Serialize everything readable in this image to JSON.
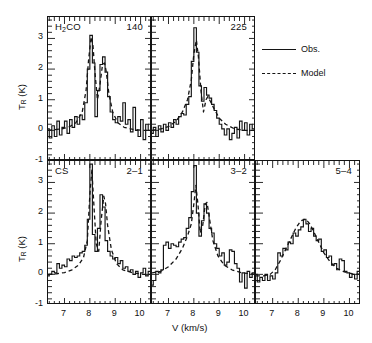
{
  "figure": {
    "axis_x_title": "V (km/s)",
    "axis_y_title": "T_R (K)",
    "y_ticks": [
      "-1",
      "0",
      "1",
      "2",
      "3"
    ],
    "x_ticks": [
      "7",
      "8",
      "9",
      "10"
    ]
  },
  "legend": {
    "obs_label": "Obs.",
    "model_label": "Model",
    "obs_style": "solid",
    "model_style": "dashed",
    "line_color": "#141414"
  },
  "panels": [
    {
      "id": "h2co-140",
      "left_label": "H2CO",
      "left_label_html": "H<sub>2</sub>CO",
      "right_label": "140",
      "row": 0,
      "col": 0
    },
    {
      "id": "h2co-225",
      "left_label": "",
      "left_label_html": "",
      "right_label": "225",
      "row": 0,
      "col": 1
    },
    {
      "id": "cs-2-1",
      "left_label": "CS",
      "left_label_html": "CS",
      "right_label": "2–1",
      "row": 1,
      "col": 0
    },
    {
      "id": "cs-3-2",
      "left_label": "",
      "left_label_html": "",
      "right_label": "3–2",
      "row": 1,
      "col": 1
    },
    {
      "id": "cs-5-4",
      "left_label": "",
      "left_label_html": "",
      "right_label": "5–4",
      "row": 1,
      "col": 2
    }
  ],
  "chart_data": {
    "type": "line",
    "title": "",
    "xlabel": "V (km/s)",
    "ylabel": "T_R (K)",
    "xlim": [
      6.35,
      10.45
    ],
    "ylim": [
      -1.0,
      3.7
    ],
    "grid": false,
    "legend_position": "right-outside",
    "series_names": [
      "Obs.",
      "Model"
    ],
    "panels": [
      {
        "name": "H2CO 140",
        "left_label": "H2CO",
        "right_label": "140",
        "obs": {
          "style": "step",
          "x": [
            6.35,
            6.45,
            6.55,
            6.65,
            6.75,
            6.85,
            6.95,
            7.05,
            7.15,
            7.25,
            7.35,
            7.45,
            7.55,
            7.65,
            7.75,
            7.85,
            7.95,
            8.05,
            8.15,
            8.25,
            8.35,
            8.45,
            8.55,
            8.65,
            8.75,
            8.85,
            8.95,
            9.05,
            9.15,
            9.25,
            9.35,
            9.45,
            9.55,
            9.65,
            9.75,
            9.85,
            9.95,
            10.05,
            10.15,
            10.25,
            10.35,
            10.45
          ],
          "y": [
            0.05,
            -0.25,
            0.15,
            -0.2,
            0.3,
            -0.15,
            0.1,
            0.3,
            -0.1,
            0.35,
            0.1,
            0.45,
            0.2,
            0.5,
            0.35,
            0.9,
            2.0,
            3.1,
            2.2,
            0.45,
            1.3,
            2.15,
            2.4,
            1.9,
            1.1,
            0.6,
            0.35,
            0.25,
            0.45,
            0.3,
            0.9,
            0.2,
            0.35,
            -0.05,
            0.75,
            0.0,
            -0.2,
            0.35,
            -0.3,
            0.2,
            0.0,
            0.05
          ]
        },
        "model": {
          "style": "smooth",
          "x": [
            6.35,
            6.6,
            6.9,
            7.2,
            7.45,
            7.7,
            7.85,
            7.95,
            8.05,
            8.12,
            8.2,
            8.3,
            8.4,
            8.5,
            8.58,
            8.65,
            8.75,
            8.9,
            9.1,
            9.35,
            9.7,
            10.1,
            10.45
          ],
          "y": [
            0.0,
            0.02,
            0.05,
            0.12,
            0.25,
            0.6,
            1.3,
            2.3,
            3.05,
            2.8,
            1.9,
            1.0,
            1.5,
            2.15,
            2.2,
            1.9,
            1.2,
            0.6,
            0.25,
            0.1,
            0.03,
            0.0,
            0.0
          ]
        }
      },
      {
        "name": "H2CO 225",
        "left_label": "",
        "right_label": "225",
        "obs": {
          "style": "step",
          "x": [
            6.35,
            6.45,
            6.55,
            6.65,
            6.75,
            6.85,
            6.95,
            7.05,
            7.15,
            7.25,
            7.35,
            7.45,
            7.55,
            7.65,
            7.75,
            7.85,
            7.95,
            8.05,
            8.15,
            8.25,
            8.35,
            8.45,
            8.55,
            8.65,
            8.75,
            8.85,
            8.95,
            9.05,
            9.15,
            9.25,
            9.35,
            9.45,
            9.55,
            9.65,
            9.75,
            9.85,
            9.95,
            10.05,
            10.15,
            10.25,
            10.35,
            10.45
          ],
          "y": [
            -0.1,
            0.1,
            -0.2,
            0.15,
            -0.05,
            0.2,
            0.0,
            0.25,
            0.1,
            0.35,
            0.2,
            0.45,
            0.55,
            0.5,
            0.85,
            1.1,
            2.25,
            3.35,
            2.55,
            1.45,
            0.95,
            1.4,
            1.15,
            1.05,
            0.85,
            0.65,
            0.4,
            0.2,
            0.05,
            -0.15,
            0.05,
            -0.3,
            -0.1,
            0.1,
            -0.25,
            0.3,
            0.0,
            0.25,
            -0.15,
            0.2,
            0.05,
            0.1
          ]
        },
        "model": {
          "style": "smooth",
          "x": [
            6.35,
            6.7,
            7.0,
            7.3,
            7.55,
            7.75,
            7.9,
            8.0,
            8.1,
            8.18,
            8.28,
            8.38,
            8.48,
            8.55,
            8.65,
            8.8,
            9.0,
            9.25,
            9.6,
            10.0,
            10.45
          ],
          "y": [
            0.0,
            0.05,
            0.12,
            0.3,
            0.6,
            1.0,
            1.65,
            2.5,
            2.95,
            2.4,
            1.3,
            0.6,
            1.0,
            1.1,
            0.95,
            0.7,
            0.4,
            0.2,
            0.05,
            0.0,
            0.0
          ]
        }
      },
      {
        "name": "CS 2-1",
        "left_label": "CS",
        "right_label": "2-1",
        "obs": {
          "style": "step",
          "x": [
            6.35,
            6.45,
            6.55,
            6.65,
            6.75,
            6.85,
            6.95,
            7.05,
            7.15,
            7.25,
            7.35,
            7.45,
            7.55,
            7.65,
            7.75,
            7.85,
            7.95,
            8.05,
            8.15,
            8.25,
            8.35,
            8.45,
            8.55,
            8.65,
            8.75,
            8.85,
            8.95,
            9.05,
            9.15,
            9.25,
            9.35,
            9.45,
            9.55,
            9.65,
            9.75,
            9.85,
            9.95,
            10.05,
            10.15,
            10.25,
            10.35,
            10.45
          ],
          "y": [
            -0.05,
            0.0,
            0.1,
            0.05,
            0.35,
            0.2,
            0.3,
            0.25,
            0.5,
            0.45,
            0.6,
            0.55,
            0.6,
            0.7,
            0.75,
            0.95,
            1.8,
            3.6,
            1.3,
            0.75,
            1.5,
            2.6,
            2.2,
            1.1,
            0.75,
            0.6,
            0.5,
            0.55,
            0.35,
            0.45,
            0.2,
            0.25,
            0.1,
            0.15,
            0.0,
            0.1,
            -0.1,
            0.05,
            0.2,
            -0.05,
            0.1,
            0.0
          ]
        },
        "model": {
          "style": "smooth",
          "x": [
            6.35,
            6.7,
            7.0,
            7.3,
            7.55,
            7.75,
            7.9,
            8.0,
            8.08,
            8.15,
            8.25,
            8.35,
            8.45,
            8.55,
            8.62,
            8.7,
            8.85,
            9.05,
            9.3,
            9.7,
            10.1,
            10.45
          ],
          "y": [
            0.0,
            0.02,
            0.06,
            0.15,
            0.3,
            0.55,
            1.1,
            2.6,
            3.4,
            2.4,
            1.0,
            0.75,
            1.8,
            2.55,
            2.3,
            1.6,
            0.8,
            0.35,
            0.15,
            0.05,
            0.0,
            0.0
          ]
        }
      },
      {
        "name": "CS 3-2",
        "left_label": "",
        "right_label": "3-2",
        "obs": {
          "style": "step",
          "x": [
            6.35,
            6.45,
            6.55,
            6.65,
            6.75,
            6.85,
            6.95,
            7.05,
            7.15,
            7.25,
            7.35,
            7.45,
            7.55,
            7.65,
            7.75,
            7.85,
            7.95,
            8.05,
            8.15,
            8.25,
            8.35,
            8.45,
            8.55,
            8.65,
            8.75,
            8.85,
            8.95,
            9.05,
            9.15,
            9.25,
            9.35,
            9.45,
            9.55,
            9.65,
            9.75,
            9.85,
            9.95,
            10.05,
            10.15,
            10.25,
            10.35,
            10.45
          ],
          "y": [
            -0.35,
            -0.2,
            0.1,
            0.05,
            0.15,
            0.95,
            1.05,
            0.85,
            1.0,
            0.95,
            0.9,
            1.05,
            1.15,
            1.2,
            1.5,
            1.85,
            2.7,
            3.55,
            2.0,
            1.25,
            1.75,
            2.3,
            2.0,
            1.5,
            1.35,
            1.0,
            0.85,
            0.6,
            0.7,
            0.3,
            0.4,
            0.8,
            0.75,
            0.35,
            0.2,
            -0.25,
            0.05,
            -0.45,
            0.1,
            -0.1,
            0.05,
            -0.3
          ]
        },
        "model": {
          "style": "smooth",
          "x": [
            6.35,
            6.7,
            7.0,
            7.3,
            7.55,
            7.75,
            7.9,
            8.0,
            8.08,
            8.16,
            8.25,
            8.35,
            8.45,
            8.52,
            8.62,
            8.75,
            8.95,
            9.2,
            9.5,
            9.9,
            10.45
          ],
          "y": [
            0.05,
            0.1,
            0.25,
            0.5,
            0.85,
            1.25,
            1.65,
            2.3,
            2.9,
            2.3,
            1.35,
            1.6,
            2.3,
            2.35,
            1.8,
            1.1,
            0.6,
            0.3,
            0.15,
            0.05,
            0.0
          ]
        }
      },
      {
        "name": "CS 5-4",
        "left_label": "",
        "right_label": "5-4",
        "obs": {
          "style": "step",
          "x": [
            6.35,
            6.45,
            6.55,
            6.65,
            6.75,
            6.85,
            6.95,
            7.05,
            7.15,
            7.25,
            7.35,
            7.45,
            7.55,
            7.65,
            7.75,
            7.85,
            7.95,
            8.05,
            8.15,
            8.25,
            8.35,
            8.45,
            8.55,
            8.65,
            8.75,
            8.85,
            8.95,
            9.05,
            9.15,
            9.25,
            9.35,
            9.45,
            9.55,
            9.65,
            9.75,
            9.85,
            9.95,
            10.05,
            10.15,
            10.25,
            10.35,
            10.45
          ],
          "y": [
            0.0,
            -0.25,
            -0.1,
            -0.2,
            0.0,
            -0.2,
            -0.05,
            -0.15,
            0.05,
            0.7,
            0.6,
            0.85,
            0.8,
            1.05,
            1.0,
            1.35,
            1.25,
            1.45,
            1.55,
            1.8,
            1.65,
            1.4,
            1.5,
            1.25,
            1.1,
            1.15,
            0.75,
            0.8,
            0.55,
            0.6,
            0.3,
            0.35,
            0.15,
            0.5,
            0.45,
            0.1,
            0.05,
            -0.1,
            0.0,
            -0.15,
            0.1,
            0.0
          ]
        },
        "model": {
          "style": "smooth",
          "x": [
            6.35,
            6.65,
            6.9,
            7.1,
            7.3,
            7.5,
            7.7,
            7.9,
            8.1,
            8.3,
            8.45,
            8.6,
            8.8,
            9.0,
            9.25,
            9.5,
            9.8,
            10.1,
            10.45
          ],
          "y": [
            -0.05,
            -0.05,
            0.0,
            0.15,
            0.45,
            0.8,
            1.15,
            1.5,
            1.75,
            1.8,
            1.65,
            1.4,
            1.05,
            0.7,
            0.4,
            0.2,
            0.08,
            0.02,
            0.0
          ]
        }
      }
    ]
  }
}
